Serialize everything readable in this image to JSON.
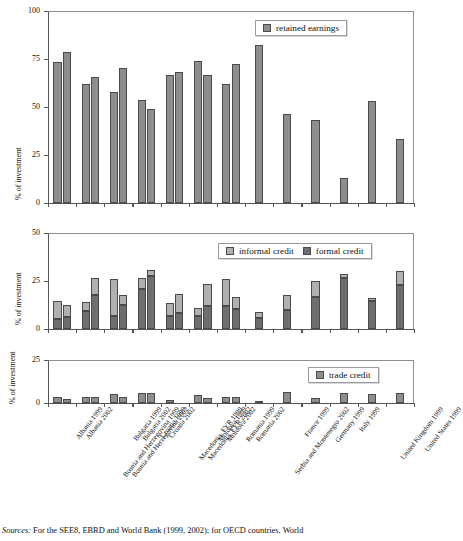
{
  "figure": {
    "source_note_prefix": "Sources:",
    "source_note": " For the SEE8, EBRD and World Bank (1999, 2002); for OECD countries, World"
  },
  "chart_data": {
    "type": "bar",
    "title": "",
    "grid": false,
    "categories": [
      "Albania 1999",
      "Albania 2002",
      "Bosnia and Herzegovina 1999",
      "Bosnia and Herzegovina 2002",
      "Bulgaria 1999",
      "Bulgaria 2002",
      "Croatia 1999",
      "Croatia 2002",
      "Macedonia, FYR 1999",
      "Macedonia, FYR 2002",
      "Moldova 1999",
      "Moldova 2002",
      "Romania 1999",
      "Romania 2002",
      "Serbia and Montenegro 2002",
      "France 1999",
      "Germany 1999",
      "Italy 1999",
      "United Kingdom 1999",
      "United States 1999"
    ],
    "panels": [
      {
        "id": "retained-earnings",
        "ylabel": "% of investment",
        "ylim": [
          0,
          100
        ],
        "yticks": [
          0,
          25,
          50,
          75,
          100
        ],
        "legend_position": "top-right",
        "series": [
          {
            "name": "retained earnings",
            "color": "#8e8e8e",
            "values": [
              73.6,
              78.6,
              62.2,
              65.5,
              58.0,
              70.3,
              53.4,
              48.7,
              66.6,
              68.0,
              74.2,
              66.6,
              62.0,
              72.2,
              82.5,
              46.6,
              43.0,
              13.2,
              53.0,
              33.3
            ]
          }
        ]
      },
      {
        "id": "credit",
        "ylabel": "% of investment",
        "ylim": [
          0,
          50
        ],
        "yticks": [
          0,
          25,
          50
        ],
        "legend_position": "top-right",
        "stacked": true,
        "series": [
          {
            "name": "formal credit",
            "color": "#6e6e6e",
            "values": [
              5.3,
              6.3,
              9.4,
              17.5,
              7.0,
              12.5,
              20.8,
              27.5,
              6.6,
              8.4,
              7.0,
              11.8,
              11.8,
              10.6,
              5.5,
              10.0,
              16.5,
              26.5,
              14.4,
              23.0
            ]
          },
          {
            "name": "informal credit",
            "color": "#b0b0b0",
            "values": [
              9.2,
              6.2,
              4.5,
              9.3,
              19.2,
              5.4,
              6.0,
              3.1,
              6.7,
              9.6,
              4.0,
              11.8,
              14.4,
              6.2,
              3.4,
              7.8,
              8.5,
              1.9,
              1.6,
              7.1
            ]
          }
        ]
      },
      {
        "id": "trade-credit",
        "ylabel": "% of investment",
        "ylim": [
          0,
          25
        ],
        "yticks": [
          0,
          25
        ],
        "legend_position": "top-right",
        "series": [
          {
            "name": "trade credit",
            "color": "#8e8e8e",
            "values": [
              3.2,
              2.6,
              3.4,
              3.4,
              5.3,
              3.2,
              5.6,
              5.6,
              1.9,
              0.0,
              4.6,
              2.8,
              3.4,
              3.4,
              1.1,
              6.3,
              2.8,
              5.6,
              5.3,
              5.9
            ]
          }
        ]
      }
    ]
  }
}
